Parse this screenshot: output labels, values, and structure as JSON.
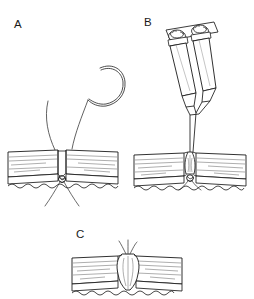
{
  "figure": {
    "type": "medical-line-illustration",
    "background_color": "#ffffff",
    "ink_color": "#1a1a1a",
    "stroke_color_light": "#555555",
    "panel_count": 3
  },
  "panels": [
    {
      "id": "A",
      "label": "A",
      "label_x": 14,
      "label_y": 28,
      "caption": "Curved needle with suture passed through wound edges; knot tied at wound base",
      "elements": [
        "curved-surgical-needle",
        "suture-thread-left",
        "suture-thread-right",
        "tissue-block-left",
        "tissue-block-right",
        "wound-gap",
        "suture-knot",
        "subcutaneous-wavy-border"
      ]
    },
    {
      "id": "B",
      "label": "B",
      "label_x": 144,
      "label_y": 26,
      "caption": "Dual-barrel applicator delivering two-component sealant into the approximated wound",
      "elements": [
        "dual-syringe-applicator",
        "syringe-barrel-left",
        "syringe-barrel-right",
        "plunger-flange-bar",
        "converging-nozzle-tip",
        "sealant-bead-in-wound",
        "tissue-block-left",
        "tissue-block-right",
        "suture-knot",
        "subcutaneous-wavy-border"
      ]
    },
    {
      "id": "C",
      "label": "C",
      "label_x": 76,
      "label_y": 238,
      "caption": "Final closed wound with sealant column and trimmed suture ends",
      "elements": [
        "tissue-block-left",
        "tissue-block-right",
        "sealant-column",
        "suture-thread-ends",
        "subcutaneous-wavy-border"
      ]
    }
  ],
  "colors": {
    "ink": "#1a1a1a",
    "hatch": "#6b6b6b",
    "thread": "#3a3a3a",
    "background": "#ffffff"
  }
}
